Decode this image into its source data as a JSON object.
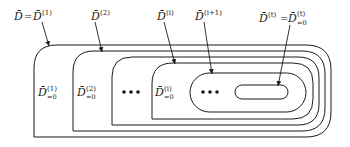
{
  "diagram": {
    "top_labels": [
      {
        "base": "D̄",
        "eq": "=",
        "base2": "D̄",
        "sup": "(1)",
        "text": "D̄=D̄(1)"
      },
      {
        "base": "D̄",
        "sup": "(2)",
        "text": "D̄(2)"
      },
      {
        "base": "D̄",
        "sup": "(i)",
        "text": "D̄(i)"
      },
      {
        "base": "D̄",
        "sup": "(i+1)",
        "text": "D̄(i+1)"
      },
      {
        "base": "D̄",
        "sup": "(t)",
        "eq": "=",
        "base2": "D̄",
        "sup2": "(t)",
        "sub2": "=0",
        "text": "D̄(t)=D̄(t)=0"
      }
    ],
    "inner_labels": [
      {
        "base": "D̄",
        "sup": "(1)",
        "sub": "=0"
      },
      {
        "base": "D̄",
        "sup": "(2)",
        "sub": "=0"
      },
      {
        "base": "D̄",
        "sup": "(i)",
        "sub": "=0"
      }
    ],
    "ellipsis": [
      "•••",
      "•••"
    ],
    "colors": {
      "stroke": "#1a1a1a",
      "background": "#ffffff"
    }
  }
}
